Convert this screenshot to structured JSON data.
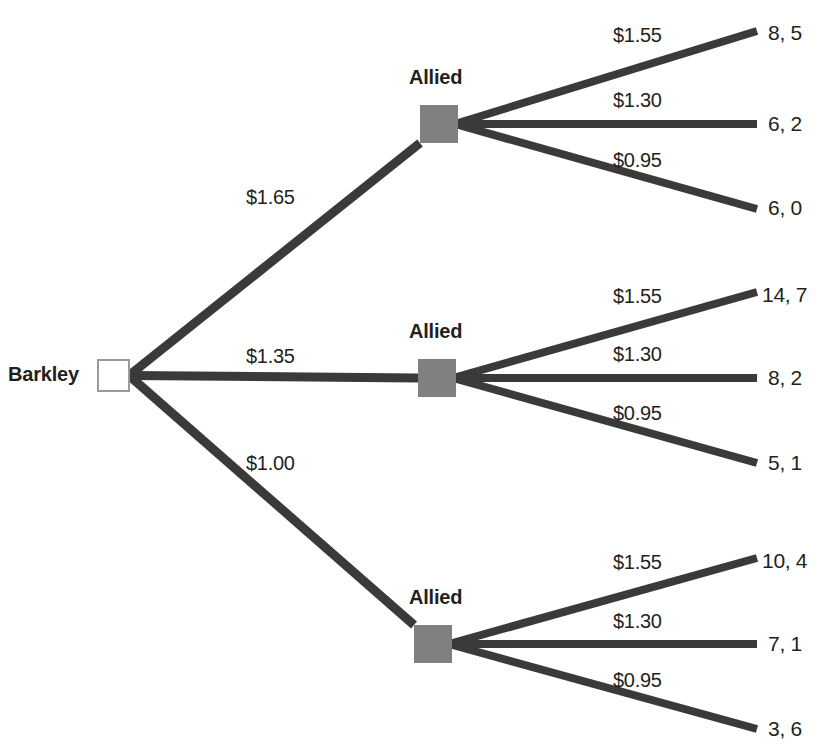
{
  "diagram": {
    "type": "game-tree",
    "background_color": "#ffffff",
    "edge_color": "#3b3a39",
    "decision_node_color": "#808080",
    "root_node_fill": "#ffffff",
    "root_node_border": "#9a9a9a",
    "text_color": "#231f20"
  },
  "root": {
    "player": "Barkley",
    "node_name": "barkley-decision-node",
    "x": 98,
    "y": 360,
    "size": 31
  },
  "barkley_branches": [
    {
      "label": "$1.65",
      "label_x": 246,
      "label_y": 186,
      "target": "allied-top"
    },
    {
      "label": "$1.35",
      "label_x": 246,
      "label_y": 345,
      "target": "allied-middle"
    },
    {
      "label": "$1.00",
      "label_x": 246,
      "label_y": 452,
      "target": "allied-bottom"
    }
  ],
  "allied_nodes": [
    {
      "id": "allied-top",
      "player": "Allied",
      "label_x": 409,
      "label_y": 66,
      "x": 420,
      "y": 105,
      "size": 38,
      "branches": [
        {
          "label": "$1.55",
          "label_x": 613,
          "label_y": 24,
          "end_x": 757,
          "end_y": 31,
          "payoff": "8, 5",
          "payoff_x": 768,
          "payoff_y": 21
        },
        {
          "label": "$1.30",
          "label_x": 613,
          "label_y": 89,
          "end_x": 757,
          "end_y": 124,
          "payoff": "6, 2",
          "payoff_x": 768,
          "payoff_y": 112
        },
        {
          "label": "$0.95",
          "label_x": 613,
          "label_y": 149,
          "end_x": 757,
          "end_y": 209,
          "payoff": "6, 0",
          "payoff_x": 768,
          "payoff_y": 196
        }
      ]
    },
    {
      "id": "allied-middle",
      "player": "Allied",
      "label_x": 409,
      "label_y": 320,
      "x": 418,
      "y": 359,
      "size": 38,
      "branches": [
        {
          "label": "$1.55",
          "label_x": 613,
          "label_y": 285,
          "end_x": 757,
          "end_y": 292,
          "payoff": "14, 7",
          "payoff_x": 762,
          "payoff_y": 283
        },
        {
          "label": "$1.30",
          "label_x": 613,
          "label_y": 343,
          "end_x": 757,
          "end_y": 378,
          "payoff": "8, 2",
          "payoff_x": 768,
          "payoff_y": 366
        },
        {
          "label": "$0.95",
          "label_x": 613,
          "label_y": 402,
          "end_x": 757,
          "end_y": 463,
          "payoff": "5, 1",
          "payoff_x": 768,
          "payoff_y": 451
        }
      ]
    },
    {
      "id": "allied-bottom",
      "player": "Allied",
      "label_x": 409,
      "label_y": 586,
      "x": 414,
      "y": 625,
      "size": 38,
      "branches": [
        {
          "label": "$1.55",
          "label_x": 613,
          "label_y": 551,
          "end_x": 757,
          "end_y": 558,
          "payoff": "10, 4",
          "payoff_x": 762,
          "payoff_y": 549
        },
        {
          "label": "$1.30",
          "label_x": 613,
          "label_y": 610,
          "end_x": 757,
          "end_y": 644,
          "payoff": "7, 1",
          "payoff_x": 768,
          "payoff_y": 632
        },
        {
          "label": "$0.95",
          "label_x": 613,
          "label_y": 669,
          "end_x": 757,
          "end_y": 729,
          "payoff": "3, 6",
          "payoff_x": 768,
          "payoff_y": 717
        }
      ]
    }
  ]
}
